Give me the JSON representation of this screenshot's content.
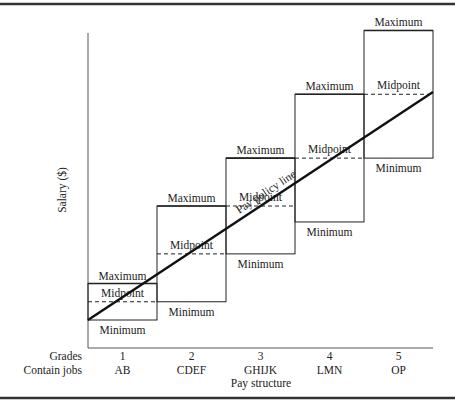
{
  "title": "Pay structure",
  "axis": {
    "y_label": "Salary ($)",
    "row_labels": {
      "grades": "Grades",
      "jobs": "Contain jobs"
    },
    "x_caption": "Pay structure"
  },
  "policy_line_label": "Pay policy line",
  "range_labels": {
    "max": "Maximum",
    "mid": "Midpoint",
    "min": "Minimum"
  },
  "grades": [
    {
      "grade": "1",
      "jobs": "AB",
      "min": 0.0,
      "mid": 0.08,
      "max": 0.16
    },
    {
      "grade": "2",
      "jobs": "CDEF",
      "min": 0.08,
      "mid": 0.29,
      "max": 0.5
    },
    {
      "grade": "3",
      "jobs": "GHIJK",
      "min": 0.29,
      "mid": 0.5,
      "max": 0.71
    },
    {
      "grade": "4",
      "jobs": "LMN",
      "min": 0.43,
      "mid": 0.71,
      "max": 0.99
    },
    {
      "grade": "5",
      "jobs": "OP",
      "min": 0.71,
      "mid": 0.99,
      "max": 1.27
    }
  ],
  "policy_line": {
    "start": 0.0,
    "end": 1.0
  },
  "colors": {
    "lines": "#222222",
    "border": "#333333"
  }
}
